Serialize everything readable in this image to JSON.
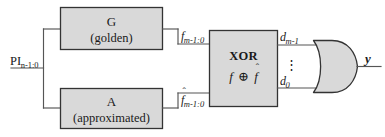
{
  "figure": {
    "colors": {
      "block_fill": "#d9d9d9",
      "block_stroke": "#333333",
      "wire": "#555555",
      "text": "#1a1a1a"
    }
  },
  "input": {
    "label_base": "PI",
    "label_sub": "n-1:0"
  },
  "blocks": {
    "golden": {
      "name": "G",
      "subtitle": "(golden)"
    },
    "approx": {
      "name": "A",
      "subtitle": "(approximated)"
    },
    "xor": {
      "name": "XOR",
      "expression_left": "f",
      "expression_op": "⊕",
      "expression_right": "f",
      "expression_right_hat": "ˆ"
    }
  },
  "signals": {
    "golden_out": {
      "base": "f",
      "sub": "m-1:0",
      "hat": ""
    },
    "approx_out": {
      "base": "f",
      "sub": "m-1:0",
      "hat": "ˆ"
    },
    "diff_msb": {
      "base": "d",
      "sub": "m-1"
    },
    "diff_ellipsis": "⋮",
    "diff_lsb": {
      "base": "d",
      "sub": "0"
    },
    "output": "y"
  },
  "gates": {
    "or_gate": "OR"
  }
}
